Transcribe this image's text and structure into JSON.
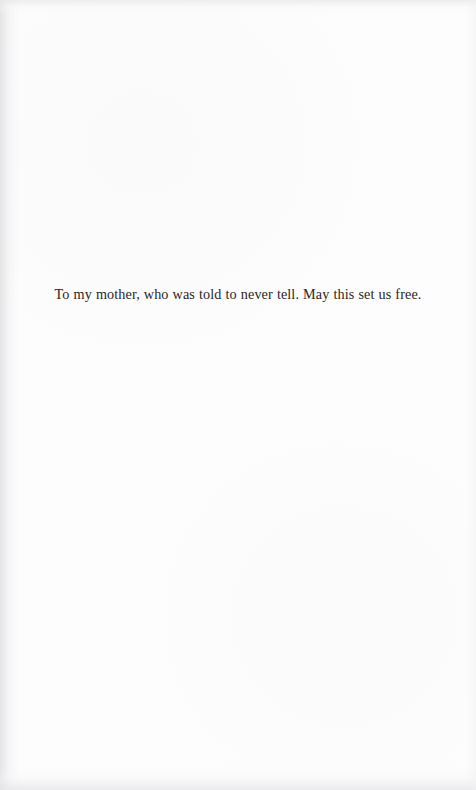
{
  "page": {
    "kind": "book-dedication-page",
    "background_color": "#fdfdfd",
    "text_color": "#2a2622"
  },
  "dedication": {
    "text": "To my mother, who was told to never tell. May this set us free."
  }
}
